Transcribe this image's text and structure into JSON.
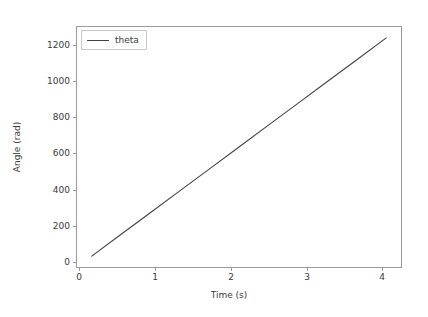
{
  "chart_data": {
    "type": "line",
    "title": "",
    "xlabel": "Time (s)",
    "ylabel": "Angle (rad)",
    "xlim": [
      -0.205,
      4.305
    ],
    "ylim": [
      -62,
      1302
    ],
    "xticks": [
      "0",
      "1",
      "2",
      "3",
      "4"
    ],
    "xtick_values": [
      0,
      1,
      2,
      3,
      4
    ],
    "yticks": [
      "0",
      "200",
      "400",
      "600",
      "800",
      "1000",
      "1200"
    ],
    "ytick_values": [
      0,
      200,
      400,
      600,
      800,
      1000,
      1200
    ],
    "grid": false,
    "legend_position": "upper left",
    "series": [
      {
        "name": "theta",
        "color": "#41414b",
        "x": [
          0,
          0.41,
          0.82,
          1.23,
          1.64,
          2.05,
          2.46,
          2.87,
          3.28,
          3.69,
          4.1
        ],
        "values": [
          0,
          124,
          248,
          372,
          496,
          620,
          744,
          868,
          992,
          1116,
          1240
        ]
      }
    ]
  },
  "legend": {
    "entries": [
      {
        "label": "theta"
      }
    ]
  }
}
